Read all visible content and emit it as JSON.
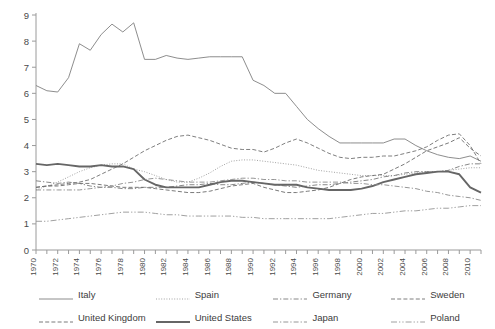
{
  "chart_data": {
    "type": "line",
    "title": "",
    "xlabel": "",
    "ylabel": "",
    "xlim": [
      1970,
      2011
    ],
    "ylim": [
      0,
      9
    ],
    "ytick_values": [
      0,
      1,
      2,
      3,
      4,
      5,
      6,
      7,
      8,
      9
    ],
    "xtick_labels": [
      "1970",
      "1972",
      "1974",
      "1976",
      "1978",
      "1980",
      "1982",
      "1984",
      "1986",
      "1988",
      "1990",
      "1992",
      "1994",
      "1996",
      "1998",
      "2000",
      "2002",
      "2004",
      "2006",
      "2008",
      "2010"
    ],
    "x": [
      1970,
      1971,
      1972,
      1973,
      1974,
      1975,
      1976,
      1977,
      1978,
      1979,
      1980,
      1981,
      1982,
      1983,
      1984,
      1985,
      1986,
      1987,
      1988,
      1989,
      1990,
      1991,
      1992,
      1993,
      1994,
      1995,
      1996,
      1997,
      1998,
      1999,
      2000,
      2001,
      2002,
      2003,
      2004,
      2005,
      2006,
      2007,
      2008,
      2009,
      2010,
      2011
    ],
    "grid": false,
    "legend_position": "bottom",
    "series": [
      {
        "name": "Italy",
        "style": "solid-thin",
        "color": "#808080",
        "values": [
          6.3,
          6.1,
          6.05,
          6.6,
          7.9,
          7.65,
          8.25,
          8.65,
          8.35,
          8.7,
          7.3,
          7.3,
          7.45,
          7.35,
          7.3,
          7.35,
          7.4,
          7.4,
          7.4,
          7.4,
          6.5,
          6.3,
          6.0,
          6.0,
          5.5,
          5.0,
          4.65,
          4.35,
          4.1,
          4.1,
          4.1,
          4.1,
          4.1,
          4.25,
          4.25,
          4.0,
          3.8,
          3.65,
          3.55,
          3.5,
          3.6,
          3.4
        ]
      },
      {
        "name": "Spain",
        "style": "dotted",
        "color": "#999999",
        "values": [
          2.3,
          2.45,
          2.6,
          2.8,
          3.0,
          3.15,
          3.25,
          3.3,
          3.3,
          3.1,
          3.0,
          2.85,
          2.7,
          2.6,
          2.6,
          2.75,
          2.95,
          3.2,
          3.4,
          3.45,
          3.45,
          3.4,
          3.35,
          3.3,
          3.25,
          3.15,
          3.05,
          3.0,
          2.95,
          2.9,
          2.85,
          2.85,
          2.85,
          2.85,
          2.9,
          2.95,
          3.0,
          3.0,
          3.05,
          3.1,
          3.15,
          3.15
        ]
      },
      {
        "name": "Germany",
        "style": "dashdot",
        "color": "#7a7a7a",
        "values": [
          2.65,
          2.6,
          2.55,
          2.6,
          2.55,
          2.45,
          2.4,
          2.4,
          2.35,
          2.35,
          2.4,
          2.4,
          2.4,
          2.45,
          2.5,
          2.5,
          2.55,
          2.5,
          2.5,
          2.55,
          2.6,
          2.55,
          2.5,
          2.45,
          2.4,
          2.45,
          2.5,
          2.5,
          2.55,
          2.6,
          2.65,
          2.7,
          2.8,
          2.85,
          2.95,
          3.0,
          3.0,
          3.0,
          3.05,
          3.2,
          3.3,
          3.3
        ]
      },
      {
        "name": "Sweden",
        "style": "dashed",
        "color": "#707070",
        "values": [
          2.4,
          2.45,
          2.5,
          2.55,
          2.6,
          2.7,
          2.9,
          3.1,
          3.3,
          3.55,
          3.8,
          4.0,
          4.2,
          4.35,
          4.4,
          4.3,
          4.2,
          4.05,
          3.9,
          3.85,
          3.85,
          3.75,
          3.9,
          4.1,
          4.25,
          4.1,
          3.9,
          3.7,
          3.55,
          3.5,
          3.55,
          3.55,
          3.6,
          3.6,
          3.7,
          3.8,
          3.95,
          4.2,
          4.4,
          4.45,
          4.0,
          3.3
        ]
      },
      {
        "name": "United Kingdom",
        "style": "dashed",
        "color": "#6b6b6b",
        "values": [
          2.4,
          2.45,
          2.45,
          2.5,
          2.55,
          2.55,
          2.5,
          2.45,
          2.4,
          2.4,
          2.4,
          2.35,
          2.3,
          2.25,
          2.2,
          2.2,
          2.25,
          2.35,
          2.45,
          2.5,
          2.55,
          2.4,
          2.3,
          2.2,
          2.2,
          2.25,
          2.3,
          2.4,
          2.55,
          2.7,
          2.8,
          2.85,
          2.9,
          3.1,
          3.3,
          3.55,
          3.8,
          3.95,
          4.1,
          4.3,
          3.9,
          3.6
        ]
      },
      {
        "name": "United States",
        "style": "solid-thick",
        "color": "#666666",
        "values": [
          3.3,
          3.25,
          3.3,
          3.25,
          3.2,
          3.2,
          3.25,
          3.2,
          3.2,
          3.1,
          2.7,
          2.5,
          2.4,
          2.4,
          2.4,
          2.4,
          2.5,
          2.6,
          2.65,
          2.65,
          2.6,
          2.55,
          2.5,
          2.5,
          2.5,
          2.4,
          2.35,
          2.3,
          2.3,
          2.3,
          2.35,
          2.45,
          2.6,
          2.7,
          2.8,
          2.9,
          2.95,
          3.0,
          3.0,
          2.9,
          2.4,
          2.2
        ]
      },
      {
        "name": "Japan",
        "style": "dashdot",
        "color": "#8a8a8a",
        "values": [
          2.3,
          2.3,
          2.3,
          2.3,
          2.3,
          2.35,
          2.4,
          2.45,
          2.55,
          2.6,
          2.7,
          2.75,
          2.7,
          2.65,
          2.6,
          2.6,
          2.6,
          2.65,
          2.7,
          2.75,
          2.75,
          2.7,
          2.7,
          2.65,
          2.65,
          2.6,
          2.6,
          2.6,
          2.6,
          2.55,
          2.55,
          2.5,
          2.5,
          2.45,
          2.4,
          2.35,
          2.25,
          2.2,
          2.1,
          2.05,
          2.0,
          1.9
        ]
      },
      {
        "name": "Poland",
        "style": "dashdotdot",
        "color": "#959595",
        "values": [
          1.1,
          1.1,
          1.15,
          1.2,
          1.25,
          1.3,
          1.35,
          1.4,
          1.45,
          1.45,
          1.45,
          1.4,
          1.35,
          1.35,
          1.3,
          1.3,
          1.3,
          1.3,
          1.3,
          1.25,
          1.25,
          1.2,
          1.2,
          1.2,
          1.2,
          1.2,
          1.2,
          1.2,
          1.25,
          1.3,
          1.35,
          1.4,
          1.4,
          1.45,
          1.5,
          1.5,
          1.55,
          1.6,
          1.6,
          1.65,
          1.7,
          1.7
        ]
      }
    ]
  },
  "legend": {
    "items": [
      {
        "label": "Italy"
      },
      {
        "label": "Spain"
      },
      {
        "label": "Germany"
      },
      {
        "label": "Sweden"
      },
      {
        "label": "United Kingdom"
      },
      {
        "label": "United States"
      },
      {
        "label": "Japan"
      },
      {
        "label": "Poland"
      }
    ]
  }
}
